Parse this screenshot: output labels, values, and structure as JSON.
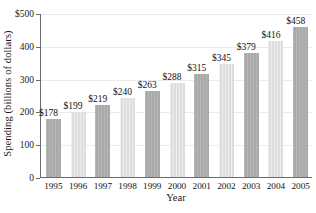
{
  "chart_data": {
    "type": "bar",
    "title": "",
    "xlabel": "Year",
    "ylabel": "Spending (billions of dollars)",
    "categories": [
      "1995",
      "1996",
      "1997",
      "1998",
      "1999",
      "2000",
      "2001",
      "2002",
      "2003",
      "2004",
      "2005"
    ],
    "values": [
      178,
      199,
      219,
      240,
      263,
      288,
      315,
      345,
      379,
      416,
      458
    ],
    "data_labels": [
      "$178",
      "$199",
      "$219",
      "$240",
      "$263",
      "$288",
      "$315",
      "$345",
      "$379",
      "$416",
      "$458"
    ],
    "bar_shades": [
      "dark",
      "light",
      "dark",
      "light",
      "dark",
      "light",
      "dark",
      "light",
      "dark",
      "light",
      "dark"
    ],
    "ylim": [
      0,
      500
    ],
    "ytick_values": [
      0,
      100,
      200,
      300,
      400,
      500
    ],
    "ytick_labels": [
      "0",
      "100",
      "200",
      "300",
      "400",
      "$500"
    ],
    "grid": true,
    "legend": "none",
    "colors": {
      "bar_dark": "#a9a9a9",
      "bar_light": "#dddddd",
      "axis": "#6b6b6b",
      "gridline": "#eceaea",
      "text": "#111111",
      "background": "#ffffff"
    }
  }
}
